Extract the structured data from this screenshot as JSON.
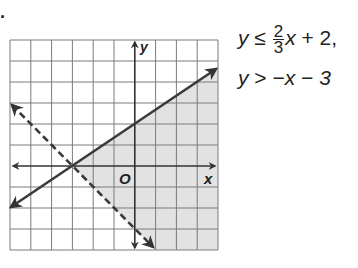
{
  "problem_marker": ".",
  "graph": {
    "x_label": "x",
    "y_label": "y",
    "origin_label": "O",
    "grid": {
      "x_min": -6,
      "x_max": 4,
      "y_min": -4,
      "y_max": 6,
      "step": 1
    },
    "colors": {
      "grid": "#7a7a7a",
      "axis": "#333333",
      "line": "#333333",
      "shade": "#e2e2e2"
    },
    "lines": [
      {
        "name": "boundary-1",
        "equation": "y = (2/3)x + 2",
        "style": "solid"
      },
      {
        "name": "boundary-2",
        "equation": "y = -x - 3",
        "style": "dashed"
      }
    ],
    "shaded_region": "below solid line and above dashed line"
  },
  "system": {
    "line1": {
      "lhs": "y",
      "op": "≤",
      "frac_num": "2",
      "frac_den": "3",
      "rest_var": "x",
      "rest": " + 2,",
      "suffix": ""
    },
    "line2": {
      "lhs": "y",
      "op": " > ",
      "rest": "−x − 3"
    }
  }
}
